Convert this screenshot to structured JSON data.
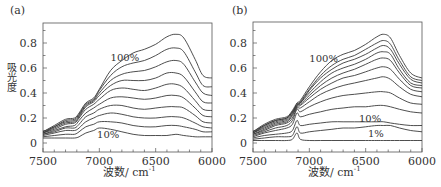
{
  "chart_data": [
    {
      "panel": "(a)",
      "type": "line",
      "title": "",
      "xlabel": "波数/ cm",
      "xlabel_sup": "-1",
      "ylabel": "吸光度",
      "xlim": [
        7500,
        6000
      ],
      "ylim": [
        -0.03,
        0.92
      ],
      "x_ticks": [
        7500,
        7000,
        6500,
        6000
      ],
      "y_ticks": [
        0,
        0.2,
        0.4,
        0.6,
        0.8
      ],
      "y_tick_labels": [
        "0",
        "0.2",
        "0.4",
        "0.6",
        "0.8"
      ],
      "grid": false,
      "annotations": [
        {
          "text": "100%",
          "x": 6900,
          "y": 0.66
        },
        {
          "text": "10%",
          "x": 7020,
          "y": 0.04
        }
      ],
      "x": [
        7500,
        7400,
        7300,
        7220,
        7180,
        7120,
        7050,
        7000,
        6900,
        6800,
        6700,
        6600,
        6500,
        6400,
        6320,
        6250,
        6150,
        6080,
        6000
      ],
      "series": [
        {
          "name": "100%",
          "values": [
            0.09,
            0.14,
            0.19,
            0.2,
            0.24,
            0.32,
            0.36,
            0.43,
            0.58,
            0.66,
            0.72,
            0.75,
            0.79,
            0.85,
            0.87,
            0.84,
            0.67,
            0.54,
            0.52
          ]
        },
        {
          "name": "90%",
          "values": [
            0.09,
            0.13,
            0.18,
            0.19,
            0.23,
            0.31,
            0.35,
            0.42,
            0.54,
            0.61,
            0.64,
            0.66,
            0.7,
            0.75,
            0.76,
            0.73,
            0.57,
            0.46,
            0.45
          ]
        },
        {
          "name": "80%",
          "values": [
            0.08,
            0.13,
            0.17,
            0.18,
            0.22,
            0.3,
            0.34,
            0.4,
            0.5,
            0.55,
            0.57,
            0.58,
            0.61,
            0.65,
            0.66,
            0.63,
            0.49,
            0.4,
            0.38
          ]
        },
        {
          "name": "70%",
          "values": [
            0.08,
            0.12,
            0.16,
            0.17,
            0.21,
            0.29,
            0.33,
            0.38,
            0.46,
            0.5,
            0.5,
            0.5,
            0.52,
            0.56,
            0.56,
            0.53,
            0.41,
            0.33,
            0.32
          ]
        },
        {
          "name": "60%",
          "values": [
            0.08,
            0.11,
            0.15,
            0.16,
            0.2,
            0.27,
            0.31,
            0.35,
            0.42,
            0.44,
            0.43,
            0.42,
            0.44,
            0.47,
            0.47,
            0.44,
            0.34,
            0.27,
            0.26
          ]
        },
        {
          "name": "50%",
          "values": [
            0.07,
            0.1,
            0.13,
            0.14,
            0.18,
            0.24,
            0.28,
            0.31,
            0.36,
            0.37,
            0.36,
            0.35,
            0.36,
            0.38,
            0.38,
            0.36,
            0.28,
            0.22,
            0.21
          ]
        },
        {
          "name": "40%",
          "values": [
            0.07,
            0.09,
            0.12,
            0.12,
            0.15,
            0.21,
            0.24,
            0.27,
            0.3,
            0.3,
            0.28,
            0.27,
            0.28,
            0.29,
            0.29,
            0.28,
            0.22,
            0.17,
            0.16
          ]
        },
        {
          "name": "30%",
          "values": [
            0.06,
            0.08,
            0.1,
            0.1,
            0.12,
            0.17,
            0.2,
            0.22,
            0.24,
            0.23,
            0.21,
            0.2,
            0.2,
            0.21,
            0.21,
            0.2,
            0.16,
            0.13,
            0.12
          ]
        },
        {
          "name": "20%",
          "values": [
            0.05,
            0.06,
            0.07,
            0.07,
            0.09,
            0.13,
            0.15,
            0.17,
            0.17,
            0.16,
            0.14,
            0.13,
            0.13,
            0.14,
            0.14,
            0.13,
            0.11,
            0.09,
            0.09
          ]
        },
        {
          "name": "10%",
          "values": [
            0.04,
            0.04,
            0.04,
            0.04,
            0.05,
            0.08,
            0.1,
            0.12,
            0.11,
            0.09,
            0.07,
            0.06,
            0.06,
            0.06,
            0.07,
            0.06,
            0.05,
            0.05,
            0.05
          ]
        }
      ]
    },
    {
      "panel": "(b)",
      "type": "line",
      "title": "",
      "xlabel": "波数/ cm",
      "xlabel_sup": "-1",
      "ylabel": "",
      "xlim": [
        7500,
        6000
      ],
      "ylim": [
        -0.03,
        0.92
      ],
      "x_ticks": [
        7500,
        7000,
        6500,
        6000
      ],
      "y_ticks": [
        0,
        0.2,
        0.4,
        0.6,
        0.8
      ],
      "y_tick_labels": [
        "0",
        "0.2",
        "0.4",
        "0.6",
        "0.8"
      ],
      "grid": false,
      "annotations": [
        {
          "text": "100%",
          "x": 7000,
          "y": 0.65
        },
        {
          "text": "10%",
          "x": 6560,
          "y": 0.17
        },
        {
          "text": "1%",
          "x": 6480,
          "y": 0.05
        }
      ],
      "x": [
        7500,
        7400,
        7300,
        7200,
        7150,
        7110,
        7080,
        7000,
        6900,
        6800,
        6700,
        6600,
        6500,
        6400,
        6340,
        6280,
        6200,
        6100,
        6000
      ],
      "series": [
        {
          "name": "100%",
          "values": [
            0.09,
            0.15,
            0.19,
            0.21,
            0.26,
            0.32,
            0.34,
            0.45,
            0.57,
            0.66,
            0.71,
            0.74,
            0.79,
            0.85,
            0.87,
            0.84,
            0.7,
            0.56,
            0.52
          ]
        },
        {
          "name": "90%",
          "values": [
            0.09,
            0.14,
            0.18,
            0.2,
            0.25,
            0.31,
            0.33,
            0.43,
            0.54,
            0.62,
            0.67,
            0.7,
            0.75,
            0.8,
            0.82,
            0.79,
            0.66,
            0.53,
            0.5
          ]
        },
        {
          "name": "80%",
          "values": [
            0.08,
            0.14,
            0.18,
            0.2,
            0.25,
            0.31,
            0.32,
            0.42,
            0.52,
            0.59,
            0.64,
            0.67,
            0.71,
            0.76,
            0.78,
            0.75,
            0.63,
            0.51,
            0.48
          ]
        },
        {
          "name": "70%",
          "values": [
            0.08,
            0.13,
            0.17,
            0.19,
            0.24,
            0.3,
            0.32,
            0.4,
            0.49,
            0.56,
            0.6,
            0.63,
            0.67,
            0.72,
            0.73,
            0.71,
            0.59,
            0.48,
            0.46
          ]
        },
        {
          "name": "60%",
          "values": [
            0.08,
            0.12,
            0.16,
            0.18,
            0.23,
            0.3,
            0.31,
            0.38,
            0.46,
            0.52,
            0.56,
            0.59,
            0.63,
            0.67,
            0.68,
            0.66,
            0.56,
            0.46,
            0.44
          ]
        },
        {
          "name": "50%",
          "values": [
            0.07,
            0.11,
            0.15,
            0.17,
            0.22,
            0.29,
            0.3,
            0.36,
            0.43,
            0.48,
            0.52,
            0.54,
            0.57,
            0.6,
            0.61,
            0.59,
            0.51,
            0.43,
            0.41
          ]
        },
        {
          "name": "40%",
          "values": [
            0.07,
            0.1,
            0.14,
            0.16,
            0.2,
            0.28,
            0.28,
            0.33,
            0.39,
            0.43,
            0.46,
            0.48,
            0.5,
            0.52,
            0.53,
            0.51,
            0.45,
            0.39,
            0.37
          ]
        },
        {
          "name": "30%",
          "values": [
            0.06,
            0.09,
            0.12,
            0.14,
            0.18,
            0.27,
            0.25,
            0.29,
            0.33,
            0.36,
            0.38,
            0.39,
            0.4,
            0.41,
            0.41,
            0.4,
            0.36,
            0.32,
            0.31
          ]
        },
        {
          "name": "20%",
          "values": [
            0.05,
            0.08,
            0.1,
            0.12,
            0.15,
            0.24,
            0.21,
            0.23,
            0.25,
            0.27,
            0.28,
            0.29,
            0.29,
            0.3,
            0.3,
            0.29,
            0.27,
            0.25,
            0.24
          ]
        },
        {
          "name": "10%",
          "values": [
            0.04,
            0.06,
            0.07,
            0.08,
            0.1,
            0.18,
            0.14,
            0.15,
            0.16,
            0.17,
            0.17,
            0.17,
            0.17,
            0.17,
            0.17,
            0.16,
            0.15,
            0.14,
            0.14
          ]
        },
        {
          "name": "5%",
          "values": [
            0.03,
            0.04,
            0.05,
            0.05,
            0.06,
            0.13,
            0.08,
            0.09,
            0.1,
            0.11,
            0.12,
            0.12,
            0.13,
            0.14,
            0.14,
            0.14,
            0.12,
            0.1,
            0.09
          ]
        },
        {
          "name": "1%",
          "values": [
            0.02,
            0.02,
            0.02,
            0.02,
            0.03,
            0.08,
            0.03,
            0.02,
            0.02,
            0.02,
            0.02,
            0.02,
            0.02,
            0.02,
            0.02,
            0.02,
            0.02,
            0.02,
            0.02
          ]
        }
      ]
    }
  ],
  "panels": {
    "a": {
      "label": "(a)",
      "ylabel": "吸光度",
      "xlabel": "波数/ cm",
      "xlabel_sup": "-1"
    },
    "b": {
      "label": "(b)",
      "xlabel": "波数/ cm",
      "xlabel_sup": "-1"
    }
  },
  "colors": {
    "line": "#3a3a3a",
    "axis": "#555555",
    "text": "#333333"
  }
}
